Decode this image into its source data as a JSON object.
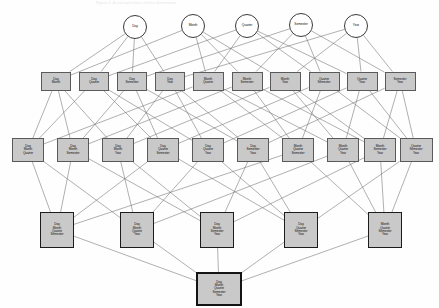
{
  "figure": {
    "title_faint": "Figure 2. A concept lattice of time dimensions",
    "type": "hasse-lattice-diagram",
    "background": "#fefefe",
    "node_fill": "#c9c9c9",
    "atom_fill": "#ffffff",
    "edge_color": "#6e6e6e"
  },
  "levels": [
    {
      "id": "level-1-atoms",
      "shape": "circle",
      "nodes": [
        {
          "id": "a0",
          "label": "Day",
          "x": 135,
          "y": 27,
          "r": 12
        },
        {
          "id": "a1",
          "label": "Month",
          "x": 193,
          "y": 26,
          "r": 12
        },
        {
          "id": "a2",
          "label": "Quarter",
          "x": 247,
          "y": 26,
          "r": 12
        },
        {
          "id": "a3",
          "label": "Semester",
          "x": 301,
          "y": 25,
          "r": 12
        },
        {
          "id": "a4",
          "label": "Year",
          "x": 356,
          "y": 26,
          "r": 12
        }
      ]
    },
    {
      "id": "level-2-pairs",
      "shape": "rect",
      "nodes": [
        {
          "id": "b0",
          "label": "Day\nMonth",
          "x": 56,
          "y": 81,
          "w": 30,
          "h": 19
        },
        {
          "id": "b1",
          "label": "Day\nQuarter",
          "x": 94,
          "y": 81,
          "w": 30,
          "h": 19
        },
        {
          "id": "b2",
          "label": "Day\nSemester",
          "x": 132,
          "y": 81,
          "w": 30,
          "h": 19
        },
        {
          "id": "b3",
          "label": "Day\nYear",
          "x": 170,
          "y": 81,
          "w": 30,
          "h": 19
        },
        {
          "id": "b4",
          "label": "Month\nQuarter",
          "x": 208,
          "y": 81,
          "w": 31,
          "h": 19
        },
        {
          "id": "b5",
          "label": "Month\nSemester",
          "x": 247,
          "y": 81,
          "w": 31,
          "h": 19
        },
        {
          "id": "b6",
          "label": "Month\nYear",
          "x": 285,
          "y": 81,
          "w": 31,
          "h": 19
        },
        {
          "id": "b7",
          "label": "Quarter\nSemester",
          "x": 324,
          "y": 81,
          "w": 31,
          "h": 19
        },
        {
          "id": "b8",
          "label": "Quarter\nYear",
          "x": 362,
          "y": 81,
          "w": 31,
          "h": 19
        },
        {
          "id": "b9",
          "label": "Semester\nYear",
          "x": 400,
          "y": 81,
          "w": 31,
          "h": 19
        }
      ]
    },
    {
      "id": "level-3-triples",
      "shape": "rect",
      "nodes": [
        {
          "id": "c0",
          "label": "Day\nMonth\nQuarter",
          "x": 28,
          "y": 150,
          "w": 32,
          "h": 24
        },
        {
          "id": "c1",
          "label": "Day\nMonth\nSemester",
          "x": 73,
          "y": 150,
          "w": 32,
          "h": 24
        },
        {
          "id": "c2",
          "label": "Day\nMonth\nYear",
          "x": 118,
          "y": 150,
          "w": 32,
          "h": 24
        },
        {
          "id": "c3",
          "label": "Day\nQuarter\nSemester",
          "x": 163,
          "y": 150,
          "w": 32,
          "h": 24
        },
        {
          "id": "c4",
          "label": "Day\nQuarter\nYear",
          "x": 208,
          "y": 150,
          "w": 32,
          "h": 24
        },
        {
          "id": "c5",
          "label": "Day\nSemester\nYear",
          "x": 253,
          "y": 150,
          "w": 32,
          "h": 24
        },
        {
          "id": "c6",
          "label": "Month\nQuarter\nSemester",
          "x": 298,
          "y": 150,
          "w": 32,
          "h": 24
        },
        {
          "id": "c7",
          "label": "Month\nQuarter\nYear",
          "x": 343,
          "y": 150,
          "w": 32,
          "h": 24
        },
        {
          "id": "c8",
          "label": "Month\nSemester\nYear",
          "x": 380,
          "y": 150,
          "w": 32,
          "h": 24
        },
        {
          "id": "c9",
          "label": "Quarter\nSemester\nYear",
          "x": 416,
          "y": 150,
          "w": 33,
          "h": 24
        }
      ]
    },
    {
      "id": "level-4-quadruples",
      "shape": "rect",
      "nodes": [
        {
          "id": "d0",
          "label": "Day\nMonth\nQuarter\nSemester",
          "x": 57,
          "y": 230,
          "w": 34,
          "h": 36
        },
        {
          "id": "d1",
          "label": "Day\nMonth\nQuarter\nYear",
          "x": 137,
          "y": 230,
          "w": 34,
          "h": 36
        },
        {
          "id": "d2",
          "label": "Day\nMonth\nSemester\nYear",
          "x": 217,
          "y": 230,
          "w": 34,
          "h": 36
        },
        {
          "id": "d3",
          "label": "Day\nQuarter\nSemester\nYear",
          "x": 301,
          "y": 230,
          "w": 34,
          "h": 36
        },
        {
          "id": "d4",
          "label": "Month\nQuarter\nSemester\nYear",
          "x": 385,
          "y": 230,
          "w": 34,
          "h": 36
        }
      ]
    },
    {
      "id": "level-5-bottom",
      "shape": "rect",
      "nodes": [
        {
          "id": "e0",
          "label": "Day\nMonth\nQuarter\nSemester\nYear",
          "x": 219,
          "y": 289,
          "w": 46,
          "h": 34
        }
      ]
    }
  ],
  "edges": [
    [
      "a0",
      "b0"
    ],
    [
      "a0",
      "b1"
    ],
    [
      "a0",
      "b2"
    ],
    [
      "a0",
      "b3"
    ],
    [
      "a1",
      "b0"
    ],
    [
      "a1",
      "b4"
    ],
    [
      "a1",
      "b5"
    ],
    [
      "a1",
      "b6"
    ],
    [
      "a2",
      "b1"
    ],
    [
      "a2",
      "b4"
    ],
    [
      "a2",
      "b7"
    ],
    [
      "a2",
      "b8"
    ],
    [
      "a3",
      "b2"
    ],
    [
      "a3",
      "b5"
    ],
    [
      "a3",
      "b7"
    ],
    [
      "a3",
      "b9"
    ],
    [
      "a4",
      "b3"
    ],
    [
      "a4",
      "b6"
    ],
    [
      "a4",
      "b8"
    ],
    [
      "a4",
      "b9"
    ],
    [
      "b0",
      "c0"
    ],
    [
      "b0",
      "c1"
    ],
    [
      "b0",
      "c2"
    ],
    [
      "b1",
      "c0"
    ],
    [
      "b1",
      "c3"
    ],
    [
      "b1",
      "c4"
    ],
    [
      "b2",
      "c1"
    ],
    [
      "b2",
      "c3"
    ],
    [
      "b2",
      "c5"
    ],
    [
      "b3",
      "c2"
    ],
    [
      "b3",
      "c4"
    ],
    [
      "b3",
      "c5"
    ],
    [
      "b4",
      "c0"
    ],
    [
      "b4",
      "c6"
    ],
    [
      "b4",
      "c7"
    ],
    [
      "b5",
      "c1"
    ],
    [
      "b5",
      "c6"
    ],
    [
      "b5",
      "c8"
    ],
    [
      "b6",
      "c2"
    ],
    [
      "b6",
      "c7"
    ],
    [
      "b6",
      "c8"
    ],
    [
      "b7",
      "c3"
    ],
    [
      "b7",
      "c6"
    ],
    [
      "b7",
      "c9"
    ],
    [
      "b8",
      "c4"
    ],
    [
      "b8",
      "c7"
    ],
    [
      "b8",
      "c9"
    ],
    [
      "b9",
      "c5"
    ],
    [
      "b9",
      "c8"
    ],
    [
      "b9",
      "c9"
    ],
    [
      "c0",
      "d0"
    ],
    [
      "c0",
      "d1"
    ],
    [
      "c1",
      "d0"
    ],
    [
      "c1",
      "d2"
    ],
    [
      "c2",
      "d1"
    ],
    [
      "c2",
      "d2"
    ],
    [
      "c3",
      "d0"
    ],
    [
      "c3",
      "d3"
    ],
    [
      "c4",
      "d1"
    ],
    [
      "c4",
      "d3"
    ],
    [
      "c5",
      "d2"
    ],
    [
      "c5",
      "d3"
    ],
    [
      "c6",
      "d0"
    ],
    [
      "c6",
      "d4"
    ],
    [
      "c7",
      "d1"
    ],
    [
      "c7",
      "d4"
    ],
    [
      "c8",
      "d2"
    ],
    [
      "c8",
      "d4"
    ],
    [
      "c9",
      "d3"
    ],
    [
      "c9",
      "d4"
    ],
    [
      "d0",
      "e0"
    ],
    [
      "d1",
      "e0"
    ],
    [
      "d2",
      "e0"
    ],
    [
      "d3",
      "e0"
    ],
    [
      "d4",
      "e0"
    ]
  ]
}
